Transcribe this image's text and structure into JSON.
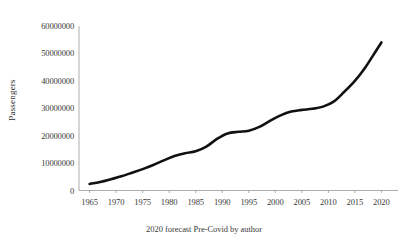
{
  "chart_data": {
    "type": "line",
    "title": "",
    "subtitle": "",
    "caption": "2020 forecast Pre-Covid by author",
    "xlabel": "",
    "ylabel": "Passengers",
    "grid": false,
    "legend": false,
    "legend_position": "none",
    "line_color": "#111111",
    "line_width_px": 2.6,
    "xlim": [
      1963,
      2022
    ],
    "ylim": [
      0,
      60000000
    ],
    "xticks": [
      1965,
      1970,
      1975,
      1980,
      1985,
      1990,
      1995,
      2000,
      2005,
      2010,
      2015,
      2020
    ],
    "xtick_labels": [
      "1965",
      "1970",
      "1975",
      "1980",
      "1985",
      "1990",
      "1995",
      "2000",
      "2005",
      "2010",
      "2015",
      "2020"
    ],
    "yticks": [
      0,
      10000000,
      20000000,
      30000000,
      40000000,
      50000000,
      60000000
    ],
    "ytick_labels": [
      "0",
      "10000000",
      "20000000",
      "30000000",
      "40000000",
      "50000000",
      "60000000"
    ],
    "x": [
      1965,
      1967,
      1969,
      1971,
      1973,
      1975,
      1977,
      1979,
      1981,
      1983,
      1985,
      1987,
      1989,
      1991,
      1993,
      1995,
      1997,
      1999,
      2001,
      2003,
      2005,
      2007,
      2009,
      2011,
      2013,
      2015,
      2017,
      2019,
      2020
    ],
    "values": [
      2400000,
      3100000,
      4100000,
      5200000,
      6500000,
      7800000,
      9300000,
      11000000,
      12600000,
      13600000,
      14300000,
      16000000,
      18800000,
      20800000,
      21400000,
      21800000,
      23200000,
      25400000,
      27400000,
      28800000,
      29400000,
      29800000,
      30600000,
      32400000,
      36000000,
      40000000,
      45000000,
      51000000,
      54000000
    ],
    "series": [
      {
        "name": "Passengers",
        "values": [
          2400000,
          3100000,
          4100000,
          5200000,
          6500000,
          7800000,
          9300000,
          11000000,
          12600000,
          13600000,
          14300000,
          16000000,
          18800000,
          20800000,
          21400000,
          21800000,
          23200000,
          25400000,
          27400000,
          28800000,
          29400000,
          29800000,
          30600000,
          32400000,
          36000000,
          40000000,
          45000000,
          51000000,
          54000000
        ]
      }
    ]
  }
}
